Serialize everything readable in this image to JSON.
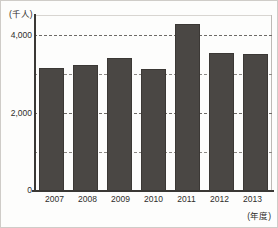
{
  "chart_data": {
    "type": "bar",
    "title": "",
    "xlabel": "(年度)",
    "ylabel": "(千人)",
    "categories": [
      "2007",
      "2008",
      "2009",
      "2010",
      "2011",
      "2012",
      "2013"
    ],
    "values": [
      3150,
      3230,
      3400,
      3120,
      4280,
      3540,
      3500
    ],
    "series": [
      {
        "name": "",
        "values": [
          3150,
          3230,
          3400,
          3120,
          4280,
          3540,
          3500
        ]
      }
    ],
    "ylim": [
      0,
      4500
    ],
    "ytick_labels": [
      "4,000",
      "2,000",
      "0"
    ],
    "ytick_values": [
      4000,
      2000,
      0
    ],
    "gridline_values": [
      4000,
      3000,
      2000,
      1000
    ],
    "grid": true,
    "legend": "none",
    "bar_color": "#4a4744",
    "axis_color": "#3a3835",
    "grid_color": "#6d6a66",
    "background_color": "#fdfdfc"
  },
  "axes": {
    "y_unit_caption": "(千人)",
    "x_unit_caption": "(年度)"
  }
}
